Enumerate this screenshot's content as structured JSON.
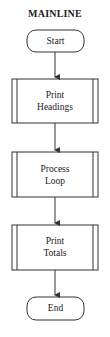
{
  "diagram": {
    "title": "MAINLINE",
    "type": "flowchart",
    "nodes": [
      {
        "id": "start",
        "shape": "terminal",
        "label": "Start"
      },
      {
        "id": "print_headings",
        "shape": "predefined-process",
        "line1": "Print",
        "line2": "Headings"
      },
      {
        "id": "process_loop",
        "shape": "predefined-process",
        "line1": "Process",
        "line2": "Loop"
      },
      {
        "id": "print_totals",
        "shape": "predefined-process",
        "line1": "Print",
        "line2": "Totals"
      },
      {
        "id": "end",
        "shape": "terminal",
        "label": "End"
      }
    ],
    "edges": [
      {
        "from": "start",
        "to": "print_headings"
      },
      {
        "from": "print_headings",
        "to": "process_loop"
      },
      {
        "from": "process_loop",
        "to": "print_totals"
      },
      {
        "from": "print_totals",
        "to": "end"
      }
    ],
    "colors": {
      "stroke": "#333333",
      "background": "#ffffff",
      "text": "#222222"
    }
  }
}
